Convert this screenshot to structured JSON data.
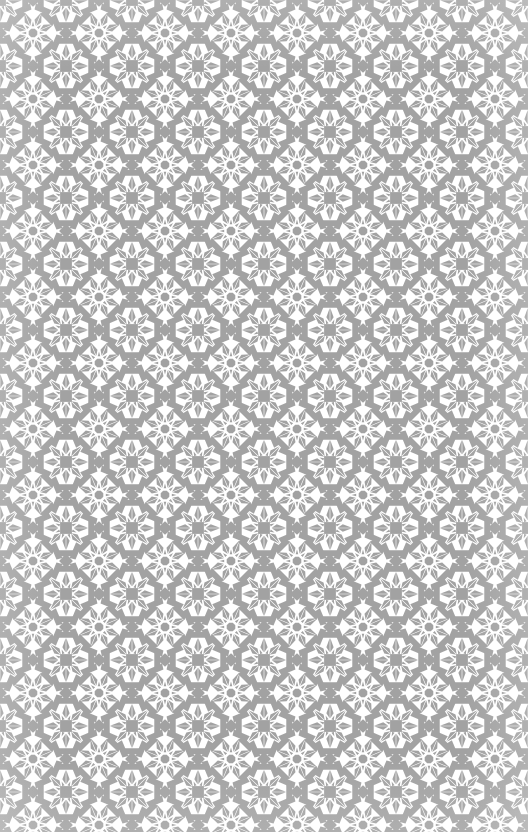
{
  "artwork": {
    "title": "Islamic Geometric Star Tiling",
    "pattern_name": "eight-point-star-rosette",
    "description": "Seamless grey-on-white interlaced strapwork tessellation of eight-pointed stars",
    "canvas": {
      "width": 528,
      "height": 832
    },
    "colors": {
      "tile_fill": "#a2a2a2",
      "strap_line": "#ffffff",
      "background": "#ffffff"
    },
    "geometry": {
      "tile_period": 66,
      "columns": 8,
      "rows": 13,
      "strap_width": 3.1,
      "star_points": 8,
      "star_inner_radius": 6.2,
      "star_outer_radius": 13.0,
      "petal_outer_radius": 23.5,
      "ring_radius": 30.5,
      "corner_square_half": 7.0,
      "rotation_offset_deg": 22.5
    },
    "render": {
      "blur_px": 0.35,
      "seamless": true,
      "cropped_at_edges": true
    }
  }
}
